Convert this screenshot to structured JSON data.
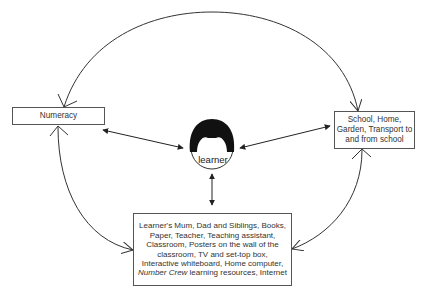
{
  "diagram": {
    "type": "concept-map",
    "center": {
      "label": "learner",
      "icon": "learner-head-icon"
    },
    "nodes": {
      "numeracy": {
        "label": "Numeracy"
      },
      "places": {
        "label": "School, Home, Garden, Transport to and from school"
      },
      "people_resources": {
        "text_before": "Learner's Mum, Dad and Siblings, Books, Paper, Teacher, Teaching assistant, Classroom, Posters on the wall of the classroom, TV and set-top box, Interactive whiteboard, Home computer, ",
        "text_italic": "Number Crew",
        "text_after": " learning resources, Internet"
      }
    },
    "edges": [
      {
        "from": "learner",
        "to": "numeracy",
        "style": "double-arrow"
      },
      {
        "from": "learner",
        "to": "places",
        "style": "double-arrow"
      },
      {
        "from": "learner",
        "to": "people_resources",
        "style": "double-arrow"
      },
      {
        "from": "numeracy",
        "to": "places",
        "style": "curved-double-arrow",
        "position": "top-arc"
      },
      {
        "from": "numeracy",
        "to": "people_resources",
        "style": "curved-double-arrow",
        "position": "left-arc"
      },
      {
        "from": "places",
        "to": "people_resources",
        "style": "curved-double-arrow",
        "position": "right-arc"
      }
    ],
    "colors": {
      "line": "#333333",
      "box_border": "#555555",
      "hair": "#111111"
    }
  }
}
